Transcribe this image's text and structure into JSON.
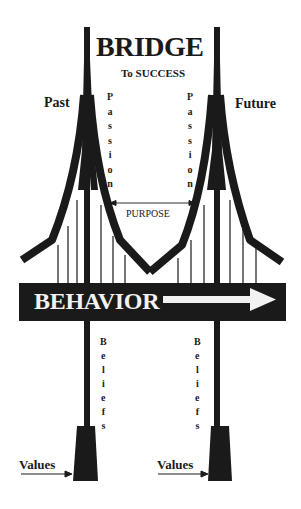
{
  "diagram": {
    "title": "BRIDGE",
    "subtitle": "To SUCCESS",
    "left_side_label": "Past",
    "right_side_label": "Future",
    "cable_label_left": [
      "P",
      "a",
      "s",
      "s",
      "i",
      "o",
      "n"
    ],
    "cable_label_right": [
      "P",
      "a",
      "s",
      "s",
      "i",
      "o",
      "n"
    ],
    "span_label": "PURPOSE",
    "deck_label": "BEHAVIOR",
    "pillar_label_left": [
      "B",
      "e",
      "l",
      "i",
      "e",
      "f",
      "s"
    ],
    "pillar_label_right": [
      "B",
      "e",
      "l",
      "i",
      "e",
      "f",
      "s"
    ],
    "foundation_label_left": "Values",
    "foundation_label_right": "Values",
    "colors": {
      "ink": "#1a1a1a",
      "background": "#ffffff",
      "deck_text": "#f2f2f2"
    },
    "elements": {
      "towers": 2,
      "deck_arrow_direction": "right",
      "span_arrow": "double-headed"
    }
  }
}
